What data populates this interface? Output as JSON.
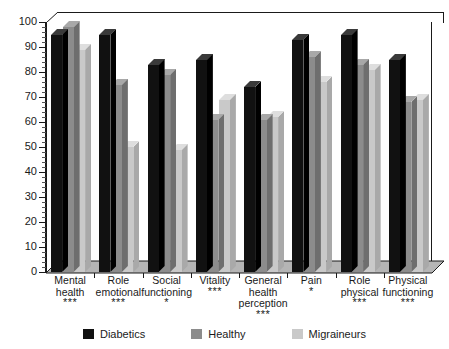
{
  "chart_data": {
    "type": "bar",
    "title": "",
    "xlabel": "",
    "ylabel": "",
    "ylim": [
      0,
      100
    ],
    "ytick_step": 10,
    "yminor_step": 2,
    "grid": false,
    "legend_position": "bottom",
    "style": "3d-clustered-column",
    "categories": [
      "Mental health",
      "Role emotional",
      "Social functioning",
      "Vitality",
      "General health perception",
      "Pain",
      "Role physical",
      "Physical functioning"
    ],
    "category_lines": [
      [
        "Mental",
        "health"
      ],
      [
        "Role",
        "emotional"
      ],
      [
        "Social",
        "functioning"
      ],
      [
        "Vitality"
      ],
      [
        "General",
        "health",
        "perception"
      ],
      [
        "Pain"
      ],
      [
        "Role",
        "physical"
      ],
      [
        "Physical",
        "functioning"
      ]
    ],
    "significance": [
      "***",
      "***",
      "*",
      "***",
      "***",
      "*",
      "***",
      "***"
    ],
    "ytick_labels": [
      "0",
      "10",
      "20",
      "30",
      "40",
      "50",
      "60",
      "70",
      "80",
      "90",
      "100"
    ],
    "series": [
      {
        "name": "Diabetics",
        "color": "#111111",
        "top_color": "#3a3a3a",
        "side_color": "#000000",
        "values": [
          95,
          95,
          83,
          85,
          74,
          93,
          95,
          85
        ]
      },
      {
        "name": "Healthy",
        "color": "#8c8c8c",
        "top_color": "#a8a8a8",
        "side_color": "#6e6e6e",
        "values": [
          98,
          75,
          79,
          61,
          61,
          86,
          83,
          68
        ]
      },
      {
        "name": "Migraineurs",
        "color": "#c9c9c9",
        "top_color": "#dedede",
        "side_color": "#a9a9a9",
        "values": [
          89,
          50,
          49,
          69,
          62,
          76,
          81,
          69
        ]
      }
    ]
  },
  "colors": {
    "axis": "#1a1a1a",
    "background": "#ffffff",
    "floor": "#b5b5b5",
    "floor_edge": "#1a1a1a"
  }
}
